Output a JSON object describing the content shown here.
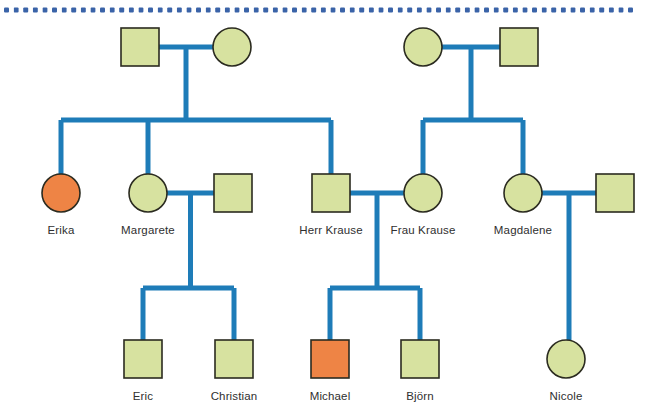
{
  "figure": {
    "type": "pedigree-chart",
    "title": "",
    "colors": {
      "affected_fill": "#EE8445",
      "unaffected_fill": "#D7E2A0",
      "shape_stroke": "#2b2b20",
      "line_stroke": "#1E7CB8",
      "label_text": "#2f2f2f",
      "rule_dot": "#3A63A8"
    },
    "legend_meaning": {
      "square": "male",
      "circle": "female",
      "orange": "affected",
      "green": "unaffected"
    }
  },
  "top_rule": {
    "name": "dotted-rule",
    "dot_count": 66,
    "dot_diameter": 5,
    "dot_gap": 9.6,
    "start_x": 4,
    "y": 10
  },
  "generations": [
    {
      "index": 1,
      "label": "",
      "members": [
        {
          "id": "g1m1",
          "label": "",
          "sex": "male",
          "shape": "square",
          "affected": false,
          "cx": 140,
          "cy": 47
        },
        {
          "id": "g1f1",
          "label": "",
          "sex": "female",
          "shape": "circle",
          "affected": false,
          "cx": 232,
          "cy": 47
        },
        {
          "id": "g1f2",
          "label": "",
          "sex": "female",
          "shape": "circle",
          "affected": false,
          "cx": 423,
          "cy": 47
        },
        {
          "id": "g1m2",
          "label": "",
          "sex": "male",
          "shape": "square",
          "affected": false,
          "cx": 519,
          "cy": 47
        }
      ]
    },
    {
      "index": 2,
      "label": "",
      "members": [
        {
          "id": "erika",
          "label": "Erika",
          "sex": "female",
          "shape": "circle",
          "affected": true,
          "cx": 61,
          "cy": 193
        },
        {
          "id": "margarete",
          "label": "Margarete",
          "sex": "female",
          "shape": "circle",
          "affected": false,
          "cx": 148,
          "cy": 193
        },
        {
          "id": "margspouse",
          "label": "",
          "sex": "male",
          "shape": "square",
          "affected": false,
          "cx": 233,
          "cy": 193
        },
        {
          "id": "herrkrause",
          "label": "Herr Krause",
          "sex": "male",
          "shape": "square",
          "affected": false,
          "cx": 331,
          "cy": 193
        },
        {
          "id": "fraukrause",
          "label": "Frau Krause",
          "sex": "female",
          "shape": "circle",
          "affected": false,
          "cx": 423,
          "cy": 193
        },
        {
          "id": "magdalene",
          "label": "Magdalene",
          "sex": "female",
          "shape": "circle",
          "affected": false,
          "cx": 523,
          "cy": 193
        },
        {
          "id": "magdspouse",
          "label": "",
          "sex": "male",
          "shape": "square",
          "affected": false,
          "cx": 615,
          "cy": 193
        }
      ]
    },
    {
      "index": 3,
      "label": "",
      "members": [
        {
          "id": "eric",
          "label": "Eric",
          "sex": "male",
          "shape": "square",
          "affected": false,
          "cx": 143,
          "cy": 359
        },
        {
          "id": "christian",
          "label": "Christian",
          "sex": "male",
          "shape": "square",
          "affected": false,
          "cx": 234,
          "cy": 359
        },
        {
          "id": "michael",
          "label": "Michael",
          "sex": "male",
          "shape": "square",
          "affected": true,
          "cx": 330,
          "cy": 359
        },
        {
          "id": "bjorn",
          "label": "Björn",
          "sex": "male",
          "shape": "square",
          "affected": false,
          "cx": 420,
          "cy": 359
        },
        {
          "id": "nicole",
          "label": "Nicole",
          "sex": "female",
          "shape": "circle",
          "affected": false,
          "cx": 566,
          "cy": 359
        }
      ]
    }
  ],
  "unions": [
    {
      "id": "u1",
      "name": "union-g1-left",
      "partners": [
        "g1m1",
        "g1f1"
      ],
      "children": [
        "erika",
        "margarete",
        "herrkrause"
      ]
    },
    {
      "id": "u2",
      "name": "union-g1-right",
      "partners": [
        "g1f2",
        "g1m2"
      ],
      "children": [
        "fraukrause",
        "magdalene"
      ]
    },
    {
      "id": "u3",
      "name": "union-margarete",
      "partners": [
        "margarete",
        "margspouse"
      ],
      "children": [
        "eric",
        "christian"
      ]
    },
    {
      "id": "u4",
      "name": "union-krause",
      "partners": [
        "herrkrause",
        "fraukrause"
      ],
      "children": [
        "michael",
        "bjorn"
      ]
    },
    {
      "id": "u5",
      "name": "union-magdalene",
      "partners": [
        "magdalene",
        "magdspouse"
      ],
      "children": [
        "nicole"
      ]
    }
  ],
  "geometry": {
    "square_size": 38,
    "circle_radius": 19,
    "label_offset_y": 25,
    "sib_bar_y_gen2": 120,
    "sib_bar_y_gen3": 288,
    "union_y_gen1": 47,
    "union_y_gen2": 193
  }
}
